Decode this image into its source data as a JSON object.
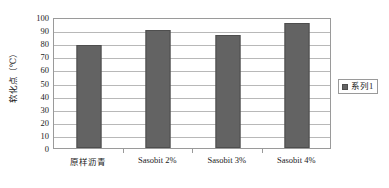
{
  "chart_data": {
    "type": "bar",
    "title": "",
    "xlabel": "",
    "ylabel": "软化点（℃）",
    "categories": [
      "原样沥青",
      "Sasobit 2%",
      "Sasobit 3%",
      "Sasobit 4%"
    ],
    "values": [
      78.5,
      90.0,
      86.0,
      95.5
    ],
    "series": [
      {
        "name": "系列1",
        "values": [
          78.5,
          90.0,
          86.0,
          95.5
        ]
      }
    ],
    "ylim": [
      0,
      100
    ],
    "ytick_step": 10,
    "yticks": [
      100,
      90,
      80,
      70,
      60,
      50,
      40,
      30,
      20,
      10,
      0
    ],
    "grid": true,
    "grid_axis": "y",
    "legend_position": "right",
    "legend": [
      "系列1"
    ],
    "bar_color": "#636363",
    "bar_border_color": "#4e4e4e",
    "gridline_color": "#b8b8b8",
    "plot_border_color": "#9a9a9a",
    "background": "#ffffff"
  },
  "legend": {
    "swatch_icon": "legend-square-icon",
    "label": "系列1"
  },
  "axes": {
    "y_title": "软化点（℃）"
  }
}
